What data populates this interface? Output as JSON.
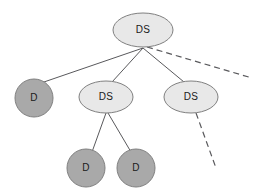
{
  "diagram": {
    "type": "tree",
    "canvas": {
      "width": 263,
      "height": 192,
      "background": "#ffffff"
    },
    "palette": {
      "ds_fill": "#e8e8e8",
      "d_fill": "#a9a9a9",
      "node_stroke": "#808080",
      "edge_color": "#59595c",
      "label_color": "#1a1a1a"
    },
    "nodes": [
      {
        "id": "root",
        "label": "DS",
        "kind": "DS",
        "shape": "ellipse",
        "cx": 143,
        "cy": 30,
        "rx": 30,
        "ry": 17,
        "fill": "#e8e8e8",
        "level": 0
      },
      {
        "id": "d-left",
        "label": "D",
        "kind": "D",
        "shape": "circle",
        "cx": 34,
        "cy": 98,
        "rx": 19,
        "ry": 19,
        "fill": "#a9a9a9",
        "level": 1
      },
      {
        "id": "ds-middle",
        "label": "DS",
        "kind": "DS",
        "shape": "ellipse",
        "cx": 106,
        "cy": 97,
        "rx": 27,
        "ry": 16,
        "fill": "#e8e8e8",
        "level": 1
      },
      {
        "id": "ds-right",
        "label": "DS",
        "kind": "DS",
        "shape": "ellipse",
        "cx": 191,
        "cy": 97,
        "rx": 27,
        "ry": 16,
        "fill": "#e8e8e8",
        "level": 1
      },
      {
        "id": "d-child-left",
        "label": "D",
        "kind": "D",
        "shape": "circle",
        "cx": 86,
        "cy": 168,
        "rx": 19,
        "ry": 19,
        "fill": "#a9a9a9",
        "level": 2
      },
      {
        "id": "d-child-right",
        "label": "D",
        "kind": "D",
        "shape": "circle",
        "cx": 136,
        "cy": 168,
        "rx": 19,
        "ry": 19,
        "fill": "#a9a9a9",
        "level": 2
      }
    ],
    "edges": [
      {
        "id": "root-to-d-left",
        "from": "root",
        "to": "d-left",
        "style": "solid",
        "x1": 143,
        "y1": 48,
        "x2": 41,
        "y2": 83
      },
      {
        "id": "root-to-ds-middle",
        "from": "root",
        "to": "ds-middle",
        "style": "solid",
        "x1": 143,
        "y1": 48,
        "x2": 112,
        "y2": 82
      },
      {
        "id": "root-to-ds-right",
        "from": "root",
        "to": "ds-right",
        "style": "solid",
        "x1": 143,
        "y1": 48,
        "x2": 184,
        "y2": 82
      },
      {
        "id": "root-continuation",
        "from": "root",
        "to": null,
        "style": "dashed",
        "x1": 147,
        "y1": 47,
        "x2": 252,
        "y2": 78
      },
      {
        "id": "ds-middle-to-d-left",
        "from": "ds-middle",
        "to": "d-child-left",
        "style": "solid",
        "x1": 106,
        "y1": 113,
        "x2": 92,
        "y2": 152
      },
      {
        "id": "ds-middle-to-d-right",
        "from": "ds-middle",
        "to": "d-child-right",
        "style": "solid",
        "x1": 108,
        "y1": 113,
        "x2": 131,
        "y2": 152
      },
      {
        "id": "ds-right-continuation",
        "from": "ds-right",
        "to": null,
        "style": "dashed",
        "x1": 196,
        "y1": 113,
        "x2": 216,
        "y2": 168
      }
    ]
  }
}
